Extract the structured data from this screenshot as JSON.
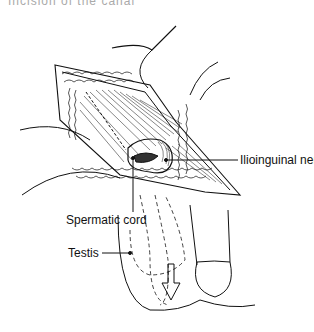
{
  "figure": {
    "cropped_header_text": "Incision of the canal",
    "labels": {
      "ilioinguinal_nerve": "Ilioinguinal nerve",
      "spermatic_cord": "Spermatic cord",
      "testis": "Testis"
    },
    "colors": {
      "line": "#111111",
      "background": "#ffffff"
    }
  }
}
